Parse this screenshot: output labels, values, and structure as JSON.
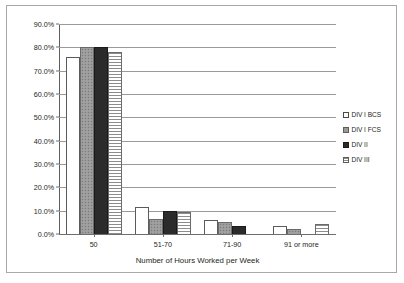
{
  "chart_data": {
    "type": "bar",
    "title": "",
    "xlabel": "Number of Hours Worked per Week",
    "ylabel": "",
    "categories": [
      "50",
      "51-70",
      "71-90",
      "91 or more"
    ],
    "ylim": [
      0,
      90
    ],
    "ytick_labels": [
      "0.0%",
      "10.0%",
      "20.0%",
      "30.0%",
      "40.0%",
      "50.0%",
      "60.0%",
      "70.0%",
      "80.0%",
      "90.0%"
    ],
    "ytick_values": [
      0,
      10,
      20,
      30,
      40,
      50,
      60,
      70,
      80,
      90
    ],
    "grid": true,
    "legend_position": "right",
    "series": [
      {
        "name": "DIV I BCS",
        "style": "white-outline",
        "values": [
          76.0,
          11.5,
          6.0,
          3.5
        ]
      },
      {
        "name": "DIV I FCS",
        "style": "grey-speckled",
        "values": [
          80.0,
          6.5,
          5.0,
          2.0
        ]
      },
      {
        "name": "DIV II",
        "style": "black-solid",
        "values": [
          80.0,
          10.0,
          3.5,
          0.0
        ]
      },
      {
        "name": "DIV III",
        "style": "horizontal-hatch",
        "values": [
          78.0,
          9.5,
          0.0,
          4.5
        ]
      }
    ]
  }
}
